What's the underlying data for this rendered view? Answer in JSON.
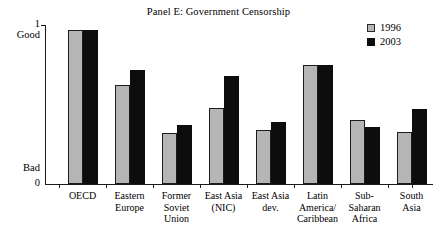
{
  "chart_data": {
    "type": "bar",
    "title": "Panel E: Government Censorship",
    "xlabel": "",
    "ylabel": "",
    "ylim": [
      0,
      1
    ],
    "grid": false,
    "legend_position": "top-right",
    "y_axis": {
      "top_tick_label": "1",
      "top_word": "Good",
      "bottom_word": "Bad",
      "bottom_tick_label": "0"
    },
    "categories": [
      "OECD",
      "Eastern Europe",
      "Former Soviet Union",
      "East Asia (NIC)",
      "East Asia dev.",
      "Latin America/ Caribbean",
      "Sub-Saharan Africa",
      "South Asia"
    ],
    "category_lines": [
      [
        "OECD"
      ],
      [
        "Eastern",
        "Europe"
      ],
      [
        "Former",
        "Soviet",
        "Union"
      ],
      [
        "East Asia",
        "(NIC)"
      ],
      [
        "East Asia",
        "dev."
      ],
      [
        "Latin",
        "America/",
        "Caribbean"
      ],
      [
        "Sub-",
        "Saharan",
        "Africa"
      ],
      [
        "South",
        "Asia"
      ]
    ],
    "series": [
      {
        "name": "1996",
        "color": "#b5b5b5",
        "values": [
          0.97,
          0.62,
          0.32,
          0.48,
          0.34,
          0.75,
          0.4,
          0.33
        ]
      },
      {
        "name": "2003",
        "color": "#0d0d0d",
        "values": [
          0.97,
          0.72,
          0.37,
          0.68,
          0.39,
          0.75,
          0.36,
          0.47
        ]
      }
    ]
  }
}
